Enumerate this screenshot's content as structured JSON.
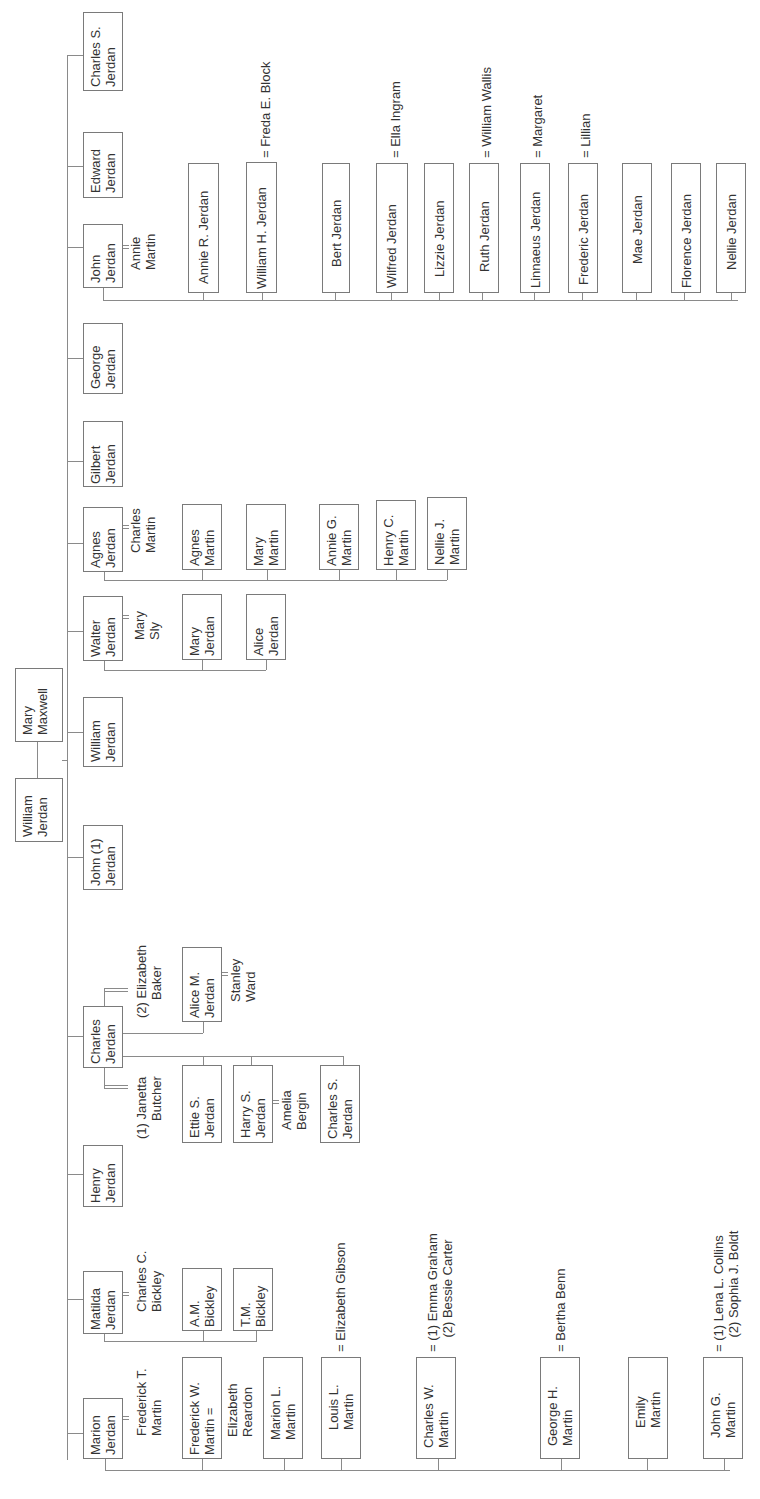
{
  "diagram": {
    "type": "family-tree",
    "orientation": "rotated-90-ccw",
    "colors": {
      "line": "#8a8a8a",
      "box_border": "#7a7a7a",
      "text": "#333333",
      "background": "#ffffff"
    },
    "root": {
      "person": "William\nJerdan",
      "spouse": "Mary\nMaxwell"
    },
    "children": [
      {
        "name": "Charles S.\nJerdan"
      },
      {
        "name": "Edward\nJerdan"
      },
      {
        "name": "John\nJerdan",
        "spouse": "Annie\nMartin",
        "children": [
          {
            "name": "Annie R. Jerdan"
          },
          {
            "name": "William H. Jerdan",
            "spouse": "= Freda E. Block"
          },
          {
            "name": "Bert Jerdan"
          },
          {
            "name": "Wilfred Jerdan",
            "spouse": "= Ella Ingram"
          },
          {
            "name": "Lizzie Jerdan"
          },
          {
            "name": "Ruth Jerdan",
            "spouse": "= William Wallis"
          },
          {
            "name": "Linnaeus Jerdan",
            "spouse": "= Margaret"
          },
          {
            "name": "Frederic Jerdan",
            "spouse": "= Lillian"
          },
          {
            "name": "Mae Jerdan"
          },
          {
            "name": "Florence Jerdan"
          },
          {
            "name": "Nellie Jerdan"
          }
        ]
      },
      {
        "name": "George\nJerdan"
      },
      {
        "name": "Gilbert\nJerdan"
      },
      {
        "name": "Agnes\nJerdan",
        "spouse": "Charles\nMartin",
        "children": [
          {
            "name": "Agnes\nMartin"
          },
          {
            "name": "Mary\nMartin"
          },
          {
            "name": "Annie G.\nMartin"
          },
          {
            "name": "Henry C.\nMartin"
          },
          {
            "name": "Nellie J.\nMartin"
          }
        ]
      },
      {
        "name": "Walter\nJerdan",
        "spouse": "Mary\nSly",
        "children": [
          {
            "name": "Mary\nJerdan"
          },
          {
            "name": "Alice\nJerdan"
          }
        ]
      },
      {
        "name": "William\nJerdan"
      },
      {
        "name": "John (1)\nJerdan"
      },
      {
        "name": "Charles\nJerdan",
        "spouse_1": "(1) Janetta\n     Butcher",
        "spouse_2": "(2) Elizabeth\n     Baker",
        "children_1": [
          {
            "name": "Ettie S.\nJerdan"
          },
          {
            "name": "Harry S.\nJerdan",
            "spouse": "Amelia\nBergin"
          },
          {
            "name": "Charles S.\nJerdan"
          }
        ],
        "children_2": [
          {
            "name": "Alice M.\nJerdan",
            "spouse": "Stanley\nWard"
          }
        ]
      },
      {
        "name": "Henry\nJerdan"
      },
      {
        "name": "Matilda\nJerdan",
        "spouse": "Charles C.\nBickley",
        "children": [
          {
            "name": "A.M.\nBickley"
          },
          {
            "name": "T.M.\nBickley"
          }
        ]
      },
      {
        "name": "Marion\nJerdan",
        "spouse": "Frederick T.\nMartin",
        "children": [
          {
            "name": "Frederick W.\nMartin =",
            "spouse": "Elizabeth\nReardon"
          },
          {
            "name": "Marion L.\nMartin"
          },
          {
            "name": "Louis L.\nMartin",
            "spouse": "= Elizabeth Gibson"
          },
          {
            "name": "Charles W.\nMartin",
            "spouse": "= (1) Emma Graham\n    (2) Bessie Carter"
          },
          {
            "name": "George H.\nMartin",
            "spouse": "= Bertha Benn"
          },
          {
            "name": "Emily\nMartin"
          },
          {
            "name": "John G.\nMartin",
            "spouse": "= (1) Lena L. Collins\n    (2) Sophia J. Boldt"
          }
        ]
      }
    ]
  }
}
